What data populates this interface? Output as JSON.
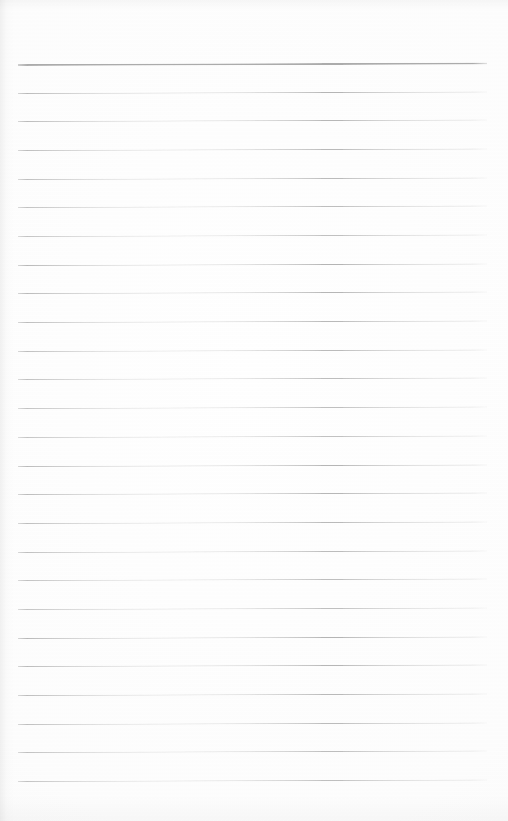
{
  "document": {
    "kind": "lined-notepad-page",
    "title": "",
    "body_text": "",
    "page_number": "",
    "date_field": "",
    "subject_field": ""
  },
  "page": {
    "width": 508,
    "height": 821,
    "background_color": "#fdfdfd",
    "orientation": "portrait"
  },
  "ruling": {
    "line_count": 26,
    "first_line_y": 64,
    "line_spacing": 28.68,
    "left_x": 18,
    "right_x": 487,
    "line_color": "#b4b4b4",
    "header_line_color": "#9a9a9a",
    "header_line_index": 0,
    "header_line_thickness": 2,
    "line_thickness": 1,
    "tilt_degrees": -0.18,
    "vertical_margin_rule": false
  },
  "content": {
    "has_handwriting": false,
    "has_printed_text": false,
    "notes": ""
  }
}
